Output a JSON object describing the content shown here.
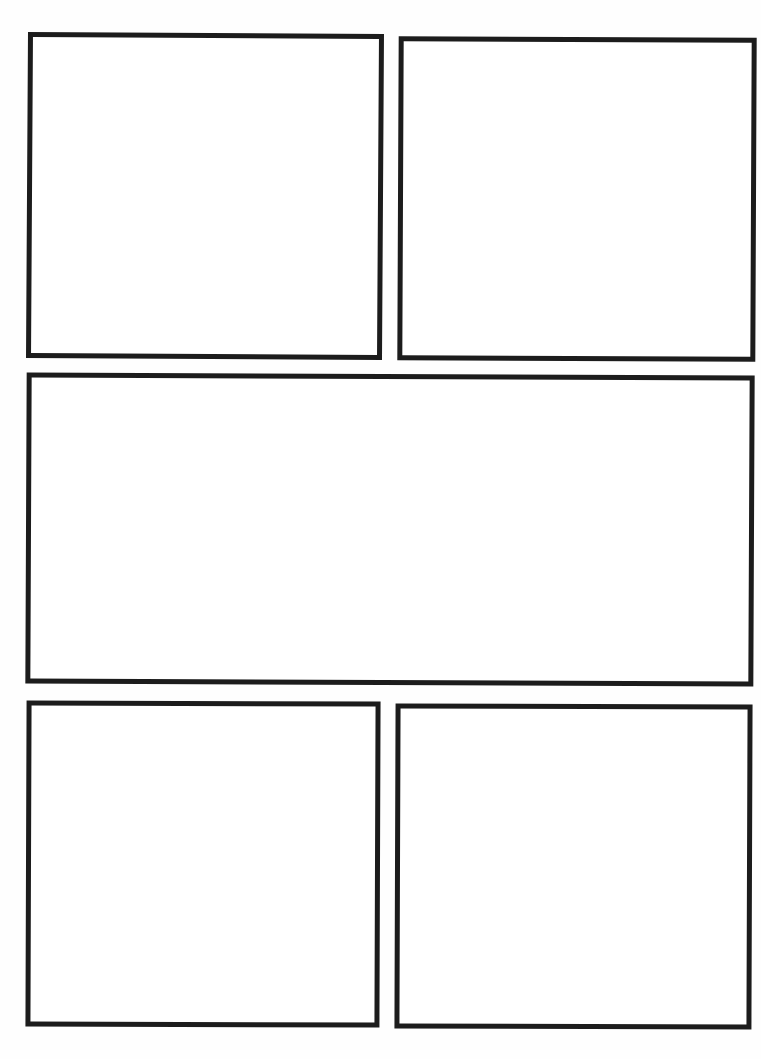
{
  "page": {
    "type": "comic-page-template",
    "panel_count": 5,
    "background_color": "#ffffff",
    "border_color": "#1c1c1c",
    "panels": [
      {
        "id": "p1",
        "row": 1,
        "position": "left",
        "content": ""
      },
      {
        "id": "p2",
        "row": 1,
        "position": "right",
        "content": ""
      },
      {
        "id": "p3",
        "row": 2,
        "position": "full-width",
        "content": ""
      },
      {
        "id": "p4",
        "row": 3,
        "position": "left",
        "content": ""
      },
      {
        "id": "p5",
        "row": 3,
        "position": "right",
        "content": ""
      }
    ]
  }
}
